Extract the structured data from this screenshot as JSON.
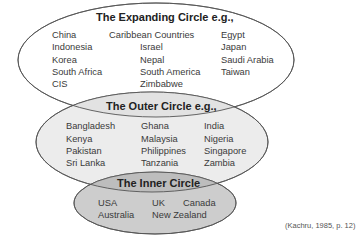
{
  "expanding_circle": {
    "title": "The Expanding Circle e.g.,",
    "columns": [
      [
        "China",
        "Indonesia",
        "Korea",
        "South Africa",
        "CIS"
      ],
      [
        "Caribbean Countries",
        "Israel",
        "Nepal",
        "South America",
        "Zimbabwe"
      ],
      [
        "Egypt",
        "Japan",
        "Saudi Arabia",
        "Taiwan"
      ]
    ]
  },
  "outer_circle": {
    "title": "The Outer Circle e.g.,",
    "columns": [
      [
        "Bangladesh",
        "Kenya",
        "Pakistan",
        "Sri Lanka"
      ],
      [
        "Ghana",
        "Malaysia",
        "Philippines",
        "Tanzania"
      ],
      [
        "India",
        "Nigeria",
        "Singapore",
        "Zambia"
      ]
    ]
  },
  "inner_circle": {
    "title": "The Inner Circle",
    "columns": [
      [
        "USA",
        "Australia"
      ],
      [
        "UK",
        "New Zealand"
      ],
      [
        "Canada"
      ]
    ]
  },
  "citation": "(Kachru, 1985, p. 12)",
  "colors": {
    "expanding_fill": "#ffffff",
    "outer_fill": "#ececec",
    "inner_fill": "#cdcdcd",
    "stroke": "#555555"
  }
}
